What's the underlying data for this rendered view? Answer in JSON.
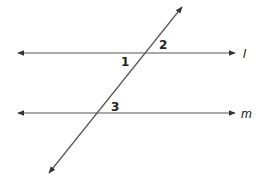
{
  "diagram": {
    "type": "parallel lines cut by a transversal",
    "line_color": "#555555",
    "text_color": "#222222",
    "lines": [
      {
        "id": "l",
        "label": "l",
        "x1": 18,
        "y1": 53,
        "x2": 235,
        "y2": 53,
        "arrows": "both"
      },
      {
        "id": "m",
        "label": "m",
        "x1": 18,
        "y1": 113,
        "x2": 235,
        "y2": 113,
        "arrows": "both"
      },
      {
        "id": "transversal",
        "label": "",
        "x1": 49,
        "y1": 173,
        "x2": 182,
        "y2": 7,
        "arrows": "both"
      }
    ],
    "angle_labels": [
      {
        "label": "1",
        "x": 121,
        "y": 66,
        "position": "below line l, left of transversal"
      },
      {
        "label": "2",
        "x": 159,
        "y": 49,
        "position": "above line l, right of transversal"
      },
      {
        "label": "3",
        "x": 111,
        "y": 111,
        "position": "above line m, right of transversal"
      }
    ],
    "line_labels": {
      "l": "l",
      "m": "m"
    }
  }
}
